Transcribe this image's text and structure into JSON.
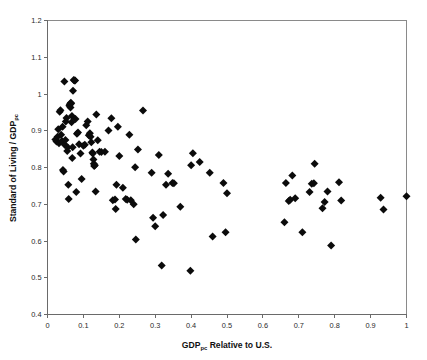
{
  "chart_data": {
    "type": "scatter",
    "title": "",
    "xlabel": "GDP_pc Relative to U.S.",
    "xlabel_main": "GDP",
    "xlabel_sub": "pc",
    "xlabel_rest": " Relative to U.S.",
    "ylabel": "Standard of Living / GDP_pc",
    "ylabel_main": "Standard of Living / GDP",
    "ylabel_sub": "pc",
    "xlim": [
      0,
      1
    ],
    "ylim": [
      0.4,
      1.2
    ],
    "xticks": [
      0,
      0.1,
      0.2,
      0.3,
      0.4,
      0.5,
      0.6,
      0.7,
      0.8,
      0.9,
      1
    ],
    "yticks": [
      0.4,
      0.5,
      0.6,
      0.7,
      0.8,
      0.9,
      1,
      1.1,
      1.2
    ],
    "xticklabels": [
      "0",
      "0.1",
      "0.2",
      "0.3",
      "0.4",
      "0.5",
      "0.6",
      "0.7",
      "0.8",
      "0.9",
      "1"
    ],
    "yticklabels": [
      "0.4",
      "0.5",
      "0.6",
      "0.7",
      "0.8",
      "0.9",
      "1",
      "1.1",
      "1.2"
    ],
    "grid": false,
    "legend": false,
    "marker": "diamond",
    "marker_color": "#0b0b0b",
    "marker_size": 4.0,
    "frame_color": "#8a8a8a",
    "background": "#ffffff",
    "n_points": 118,
    "points": [
      [
        0.022,
        0.876
      ],
      [
        0.025,
        0.871
      ],
      [
        0.028,
        0.884
      ],
      [
        0.03,
        0.904
      ],
      [
        0.032,
        0.866
      ],
      [
        0.034,
        0.952
      ],
      [
        0.036,
        0.956
      ],
      [
        0.038,
        0.889
      ],
      [
        0.04,
        0.872
      ],
      [
        0.042,
        0.911
      ],
      [
        0.043,
        0.793
      ],
      [
        0.045,
        0.789
      ],
      [
        0.047,
        1.034
      ],
      [
        0.048,
        0.862
      ],
      [
        0.05,
        0.875
      ],
      [
        0.051,
        0.925
      ],
      [
        0.053,
        0.935
      ],
      [
        0.055,
        0.845
      ],
      [
        0.056,
        0.855
      ],
      [
        0.058,
        0.753
      ],
      [
        0.059,
        0.714
      ],
      [
        0.061,
        0.968
      ],
      [
        0.062,
        0.972
      ],
      [
        0.064,
        0.963
      ],
      [
        0.065,
        0.976
      ],
      [
        0.066,
        0.974
      ],
      [
        0.067,
        0.923
      ],
      [
        0.068,
        0.94
      ],
      [
        0.069,
        0.826
      ],
      [
        0.07,
        0.855
      ],
      [
        0.071,
        1.009
      ],
      [
        0.073,
        1.038
      ],
      [
        0.075,
        1.037
      ],
      [
        0.077,
        1.037
      ],
      [
        0.078,
        0.932
      ],
      [
        0.08,
        0.733
      ],
      [
        0.082,
        0.892
      ],
      [
        0.085,
        0.895
      ],
      [
        0.088,
        0.863
      ],
      [
        0.092,
        0.838
      ],
      [
        0.095,
        0.769
      ],
      [
        0.1,
        0.859
      ],
      [
        0.104,
        0.862
      ],
      [
        0.108,
        0.915
      ],
      [
        0.112,
        0.925
      ],
      [
        0.115,
        0.888
      ],
      [
        0.118,
        0.893
      ],
      [
        0.12,
        0.884
      ],
      [
        0.122,
        0.869
      ],
      [
        0.125,
        0.841
      ],
      [
        0.126,
        0.838
      ],
      [
        0.128,
        0.822
      ],
      [
        0.129,
        0.81
      ],
      [
        0.13,
        0.804
      ],
      [
        0.132,
        0.806
      ],
      [
        0.134,
        0.735
      ],
      [
        0.136,
        0.944
      ],
      [
        0.14,
        0.874
      ],
      [
        0.145,
        0.843
      ],
      [
        0.15,
        0.842
      ],
      [
        0.16,
        0.843
      ],
      [
        0.17,
        0.901
      ],
      [
        0.178,
        0.934
      ],
      [
        0.182,
        0.711
      ],
      [
        0.188,
        0.713
      ],
      [
        0.19,
        0.687
      ],
      [
        0.192,
        0.753
      ],
      [
        0.196,
        0.911
      ],
      [
        0.2,
        0.831
      ],
      [
        0.21,
        0.745
      ],
      [
        0.218,
        0.714
      ],
      [
        0.222,
        0.712
      ],
      [
        0.228,
        0.889
      ],
      [
        0.232,
        0.711
      ],
      [
        0.24,
        0.7
      ],
      [
        0.244,
        0.801
      ],
      [
        0.246,
        0.604
      ],
      [
        0.252,
        0.849
      ],
      [
        0.266,
        0.955
      ],
      [
        0.29,
        0.786
      ],
      [
        0.294,
        0.663
      ],
      [
        0.3,
        0.64
      ],
      [
        0.31,
        0.834
      ],
      [
        0.318,
        0.533
      ],
      [
        0.322,
        0.671
      ],
      [
        0.33,
        0.753
      ],
      [
        0.336,
        0.783
      ],
      [
        0.348,
        0.758
      ],
      [
        0.352,
        0.757
      ],
      [
        0.37,
        0.693
      ],
      [
        0.398,
        0.519
      ],
      [
        0.4,
        0.806
      ],
      [
        0.405,
        0.839
      ],
      [
        0.424,
        0.815
      ],
      [
        0.452,
        0.786
      ],
      [
        0.46,
        0.612
      ],
      [
        0.49,
        0.758
      ],
      [
        0.496,
        0.624
      ],
      [
        0.5,
        0.73
      ],
      [
        0.66,
        0.651
      ],
      [
        0.664,
        0.758
      ],
      [
        0.672,
        0.709
      ],
      [
        0.676,
        0.712
      ],
      [
        0.682,
        0.778
      ],
      [
        0.69,
        0.716
      ],
      [
        0.71,
        0.624
      ],
      [
        0.73,
        0.733
      ],
      [
        0.736,
        0.756
      ],
      [
        0.742,
        0.757
      ],
      [
        0.744,
        0.81
      ],
      [
        0.766,
        0.689
      ],
      [
        0.772,
        0.706
      ],
      [
        0.78,
        0.735
      ],
      [
        0.79,
        0.588
      ],
      [
        0.812,
        0.76
      ],
      [
        0.818,
        0.71
      ],
      [
        0.928,
        0.718
      ],
      [
        0.936,
        0.686
      ],
      [
        1.0,
        0.722
      ]
    ]
  },
  "figure": {
    "name": "scatter-plot-standard-of-living-vs-gdp"
  }
}
